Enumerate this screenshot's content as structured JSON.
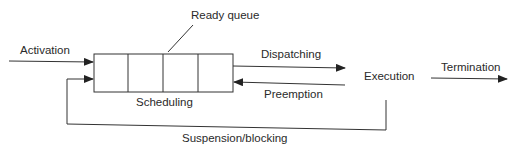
{
  "diagram": {
    "type": "process-state-flow",
    "labels": {
      "activation": "Activation",
      "ready_queue": "Ready queue",
      "dispatching": "Dispatching",
      "execution": "Execution",
      "termination": "Termination",
      "preemption": "Preemption",
      "scheduling": "Scheduling",
      "suspension": "Suspension/blocking"
    },
    "queue": {
      "slots": 4
    },
    "colors": {
      "stroke": "#333333",
      "text": "#2a2a2a",
      "background": "#ffffff"
    }
  }
}
